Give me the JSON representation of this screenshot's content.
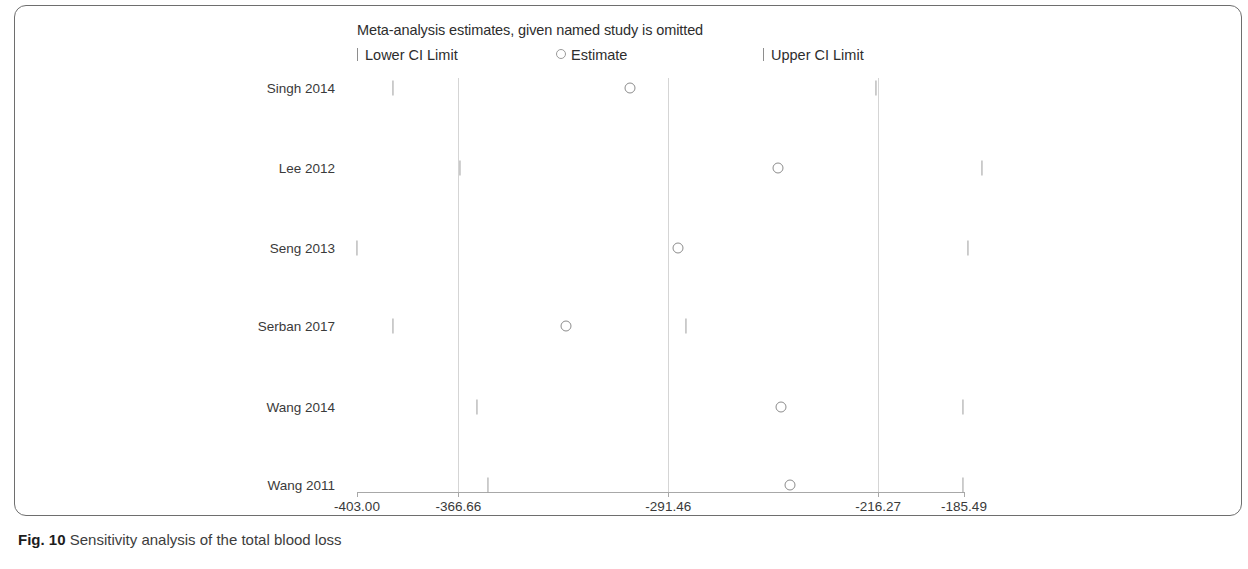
{
  "figure": {
    "caption_label": "Fig. 10",
    "caption_text": "Sensitivity analysis of the total blood loss"
  },
  "chart_data": {
    "type": "scatter",
    "title": "Meta-analysis estimates, given named study is omitted",
    "xlabel": "",
    "ylabel": "",
    "xlim": [
      -403.0,
      -185.49
    ],
    "grid": true,
    "legend_position": "top",
    "legend": [
      {
        "key": "lower_ci",
        "label": "Lower CI Limit",
        "marker": "tick"
      },
      {
        "key": "estimate",
        "label": "Estimate",
        "marker": "open-circle"
      },
      {
        "key": "upper_ci",
        "label": "Upper CI Limit",
        "marker": "tick"
      }
    ],
    "xticks": [
      -403.0,
      -366.66,
      -291.46,
      -216.27,
      -185.49
    ],
    "xticklabels": [
      "-403.00",
      "-366.66",
      "-291.46",
      "-216.27",
      "-185.49"
    ],
    "categories": [
      "Singh 2014",
      "Lee 2012",
      "Seng 2013",
      "Serban 2017",
      "Wang 2014",
      "Wang 2011"
    ],
    "series": [
      {
        "name": "Lower CI Limit",
        "values": [
          -390.0,
          -366.0,
          -403.0,
          -390.0,
          -360.0,
          -356.0
        ]
      },
      {
        "name": "Estimate",
        "values": [
          -305.0,
          -252.0,
          -288.0,
          -328.0,
          -251.0,
          -248.0
        ]
      },
      {
        "name": "Upper CI Limit",
        "values": [
          -217.0,
          -179.0,
          -184.0,
          -285.0,
          -186.0,
          -186.0
        ]
      }
    ],
    "points": [
      {
        "study": "Singh 2014",
        "lower": -390.0,
        "estimate": -305.0,
        "upper": -217.0
      },
      {
        "study": "Lee 2012",
        "lower": -366.0,
        "estimate": -252.0,
        "upper": -179.0
      },
      {
        "study": "Seng 2013",
        "lower": -403.0,
        "estimate": -288.0,
        "upper": -184.0
      },
      {
        "study": "Serban 2017",
        "lower": -390.0,
        "estimate": -328.0,
        "upper": -285.0
      },
      {
        "study": "Wang 2014",
        "lower": -360.0,
        "estimate": -251.0,
        "upper": -186.0
      },
      {
        "study": "Wang 2011",
        "lower": -356.0,
        "estimate": -248.0,
        "upper": -186.0
      }
    ]
  }
}
